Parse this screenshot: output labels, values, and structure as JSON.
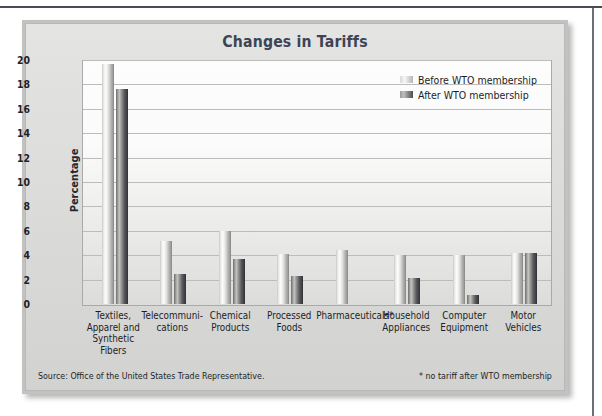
{
  "chart_data": {
    "type": "bar",
    "title": "Changes in Tariffs",
    "xlabel": "",
    "ylabel": "Percentage",
    "ylim": [
      0,
      20
    ],
    "ytick_step": 2,
    "yticks": [
      20,
      18,
      16,
      14,
      12,
      10,
      8,
      6,
      4,
      2,
      0
    ],
    "grid": true,
    "legend_position": "top-right",
    "categories": [
      "Textiles, Apparel and Synthetic Fibers",
      "Telecommuni-cations",
      "Chemical Products",
      "Processed Foods",
      "Pharmaceuticals*",
      "Household Appliances",
      "Computer Equipment",
      "Motor Vehicles"
    ],
    "category_lines": [
      [
        "Textiles,",
        "Apparel and",
        "Synthetic Fibers"
      ],
      [
        "Telecommuni-",
        "cations"
      ],
      [
        "Chemical",
        "Products"
      ],
      [
        "Processed",
        "Foods"
      ],
      [
        "Pharmaceuticals*"
      ],
      [
        "Household",
        "Appliances"
      ],
      [
        "Computer",
        "Equipment"
      ],
      [
        "Motor",
        "Vehicles"
      ]
    ],
    "series": [
      {
        "name": "Before WTO membership",
        "values": [
          19.7,
          5.2,
          6.0,
          4.1,
          4.4,
          4.0,
          4.0,
          4.2
        ]
      },
      {
        "name": "After WTO membership",
        "values": [
          17.6,
          2.5,
          3.7,
          2.3,
          0,
          2.1,
          0.7,
          4.2
        ]
      }
    ],
    "annotations": [
      "Source: Office of the United States Trade Representative.",
      "* no tariff after WTO membership"
    ]
  },
  "chart": {
    "title": "Changes in Tariffs",
    "y_axis_title": "Percentage"
  },
  "legend": {
    "items": [
      {
        "label": "Before WTO membership",
        "swatch": "before"
      },
      {
        "label": "After WTO membership",
        "swatch": "after"
      }
    ]
  },
  "footnotes": {
    "source": "Source: Office of the United States Trade Representative.",
    "asterisk": "* no tariff after WTO membership"
  },
  "colors": {
    "title": "#3c4455",
    "text": "#1c1f26",
    "panel": "#dcdcda",
    "gridline": "#bcbcba",
    "bar_before": "#e8e8e6",
    "bar_after": "#4c4c50"
  }
}
